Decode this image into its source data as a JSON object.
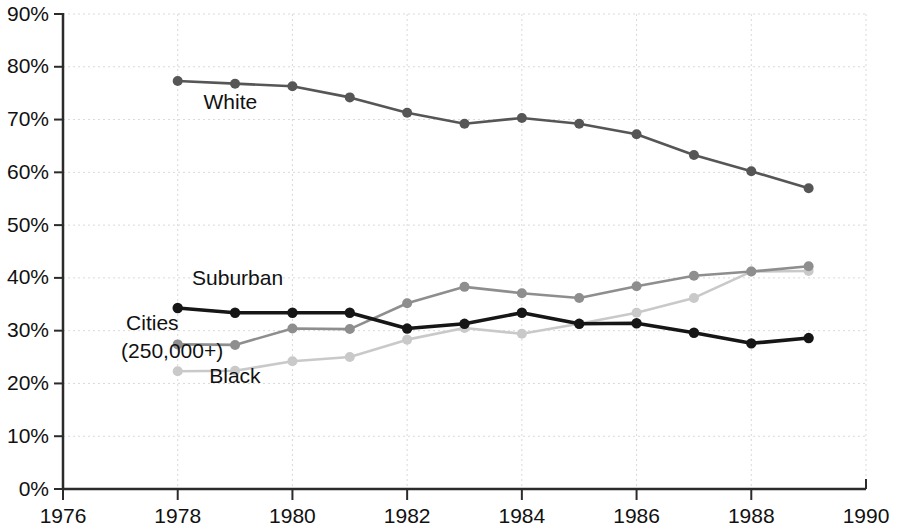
{
  "chart_data": {
    "type": "line",
    "title": "",
    "subtitle": "",
    "xlabel": "",
    "ylabel": "",
    "xlim": [
      1976,
      1990
    ],
    "ylim": [
      0,
      90
    ],
    "grid": true,
    "legend_position": "inline-labels",
    "x_tick_labels": [
      "1976",
      "1978",
      "1980",
      "1982",
      "1984",
      "1986",
      "1988",
      "1990"
    ],
    "x_ticks": [
      1976,
      1978,
      1980,
      1982,
      1984,
      1986,
      1988,
      1990
    ],
    "y_tick_labels": [
      "0%",
      "10%",
      "20%",
      "30%",
      "40%",
      "50%",
      "60%",
      "70%",
      "80%",
      "90%"
    ],
    "y_ticks": [
      0,
      10,
      20,
      30,
      40,
      50,
      60,
      70,
      80,
      90
    ],
    "x": [
      1978,
      1979,
      1980,
      1981,
      1982,
      1983,
      1984,
      1985,
      1986,
      1987,
      1988,
      1989
    ],
    "series": [
      {
        "name": "White",
        "color": "#565656",
        "label": "White",
        "label_x": 1978.45,
        "label_y": 72.0,
        "values": [
          77.3,
          76.8,
          76.3,
          74.2,
          71.3,
          69.2,
          70.3,
          69.2,
          67.2,
          63.3,
          60.2,
          57.0
        ]
      },
      {
        "name": "Suburban",
        "color": "#8e8e8e",
        "label": "Suburban",
        "label_x": 1978.25,
        "label_y": 38.6,
        "values": [
          27.4,
          27.3,
          30.4,
          30.3,
          35.2,
          38.3,
          37.1,
          36.2,
          38.4,
          40.4,
          41.2,
          42.2
        ]
      },
      {
        "name": "Cities (250,000+)",
        "color": "#161616",
        "label": "Cities\n(250,000+)",
        "label_line1": "Cities",
        "label_line2": "(250,000+)",
        "label_x": 1977.1,
        "label_y": 30.2,
        "values": [
          34.3,
          33.4,
          33.4,
          33.4,
          30.4,
          31.3,
          33.4,
          31.3,
          31.4,
          29.6,
          27.6,
          28.6
        ]
      },
      {
        "name": "Black",
        "color": "#c9c9c9",
        "label": "Black",
        "label_x": 1978.55,
        "label_y": 20.0,
        "values": [
          22.3,
          22.4,
          24.2,
          25.0,
          28.3,
          30.5,
          29.4,
          31.3,
          33.4,
          36.2,
          41.2,
          41.3
        ]
      }
    ]
  },
  "colors": {
    "gridline": "#d9d9d9",
    "axis": "#2b2b2b",
    "text": "#111111",
    "background": "#ffffff"
  }
}
